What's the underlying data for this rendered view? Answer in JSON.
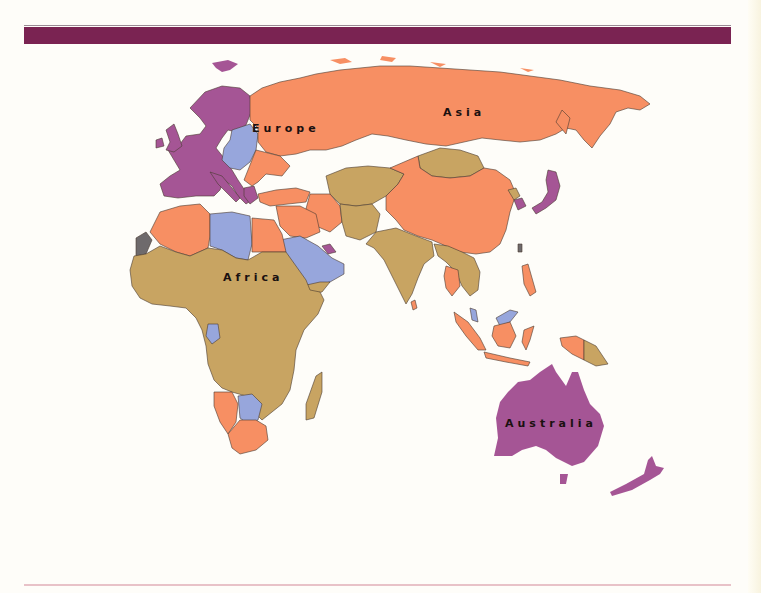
{
  "map": {
    "title": "",
    "region": "Eastern Hemisphere",
    "labels": {
      "europe": "Europe",
      "asia": "Asia",
      "africa": "Africa",
      "australia": "Australia"
    },
    "colors": {
      "header_bar": "#7a2352",
      "category_purple": "#a55595",
      "category_salmon": "#f78f63",
      "category_tan": "#c8a462",
      "category_blue": "#97a6dc",
      "category_gray": "#6e6a6c",
      "ocean": "#fefdf9",
      "border": "#4a3a30"
    },
    "categories": [
      {
        "color": "#a55595",
        "regions": [
          "Western Europe",
          "Scandinavia",
          "Japan",
          "South Korea",
          "Australia",
          "New Zealand",
          "Qatar/UAE"
        ]
      },
      {
        "color": "#f78f63",
        "regions": [
          "Russia",
          "China",
          "Turkey",
          "Iran",
          "Algeria",
          "Egypt",
          "Namibia",
          "South Africa",
          "Thailand",
          "Indonesia",
          "Philippines",
          "Sri Lanka",
          "Balkans",
          "Ukraine"
        ]
      },
      {
        "color": "#c8a462",
        "regions": [
          "Sub-Saharan Africa",
          "India",
          "Pakistan",
          "Afghanistan",
          "Central Asia",
          "Mongolia",
          "Myanmar",
          "Vietnam",
          "Papua New Guinea",
          "Madagascar",
          "Yemen"
        ]
      },
      {
        "color": "#97a6dc",
        "regions": [
          "Libya",
          "Saudi Arabia",
          "Oman",
          "Poland",
          "Czechia",
          "Hungary",
          "Baltics",
          "Gabon",
          "Botswana",
          "Malaysia"
        ]
      },
      {
        "color": "#6e6a6c",
        "regions": [
          "Western Sahara",
          "Taiwan"
        ]
      }
    ]
  }
}
